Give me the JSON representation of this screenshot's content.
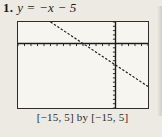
{
  "problem": {
    "number": "1.",
    "equation": "y = −x − 5"
  },
  "figure": {
    "caption": "[−15, 5] by [−15, 5]"
  },
  "colors": {
    "page_background": "#edeae4",
    "plot_background": "#f6f5f0",
    "ink": "#1c1c1c",
    "box_border": "#2d2d2d"
  },
  "chart_data": {
    "type": "line",
    "title": "y = −x − 5",
    "xlabel": "",
    "ylabel": "",
    "xlim": [
      -15,
      5
    ],
    "ylim": [
      -15,
      5
    ],
    "x_tick_step": 1,
    "y_tick_step": 1,
    "grid": false,
    "legend": "none",
    "axes_cross_at": {
      "x": 0,
      "y": 0
    },
    "tick_direction": {
      "x_axis": "below",
      "y_axis": "left"
    },
    "line_style": "dashed-pixelated",
    "series": [
      {
        "name": "y = −x − 5",
        "slope": -1,
        "y_intercept": -5,
        "x_intercept": -5,
        "visible_endpoints": [
          {
            "x": -10,
            "y": 5
          },
          {
            "x": 5,
            "y": -10
          }
        ]
      }
    ],
    "window_caption": "[−15, 5] by [−15, 5]"
  }
}
